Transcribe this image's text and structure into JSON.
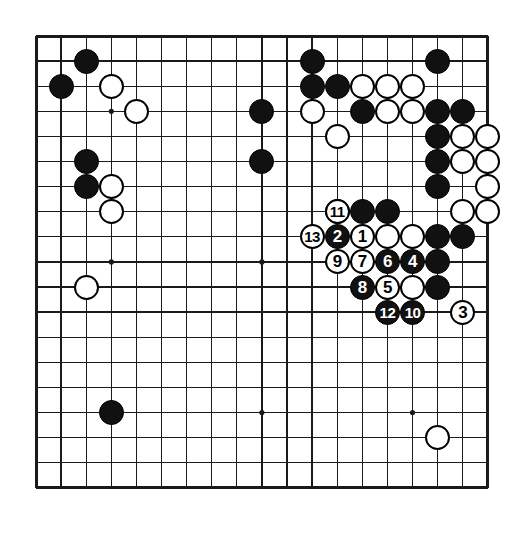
{
  "diagram": {
    "kind": "go-board-diagram",
    "board_size": 19,
    "colors": {
      "board_background": "#ffffff",
      "grid_line": "#1a1a1a",
      "black_stone": "#111111",
      "white_stone": "#ffffff",
      "stone_outline": "#000000",
      "black_number_text": "#ffffff",
      "white_number_text": "#000000"
    },
    "geometry": {
      "origin_x": 7,
      "origin_y": 7,
      "spacing": 25.1,
      "stone_diameter": 25,
      "border_width": 3
    },
    "star_points": [
      {
        "col": 4,
        "row": 4
      },
      {
        "col": 10,
        "row": 4
      },
      {
        "col": 16,
        "row": 4
      },
      {
        "col": 4,
        "row": 10
      },
      {
        "col": 10,
        "row": 10
      },
      {
        "col": 16,
        "row": 10
      },
      {
        "col": 4,
        "row": 16
      },
      {
        "col": 10,
        "row": 16
      },
      {
        "col": 16,
        "row": 16
      }
    ]
  },
  "stones": {
    "black_plain": [
      {
        "col": 3,
        "row": 2
      },
      {
        "col": 2,
        "row": 3
      },
      {
        "col": 3,
        "row": 6
      },
      {
        "col": 3,
        "row": 7
      },
      {
        "col": 10,
        "row": 4
      },
      {
        "col": 10,
        "row": 6
      },
      {
        "col": 12,
        "row": 3
      },
      {
        "col": 13,
        "row": 3
      },
      {
        "col": 12,
        "row": 2
      },
      {
        "col": 14,
        "row": 4
      },
      {
        "col": 17,
        "row": 2
      },
      {
        "col": 17,
        "row": 4
      },
      {
        "col": 18,
        "row": 4
      },
      {
        "col": 17,
        "row": 5
      },
      {
        "col": 17,
        "row": 6
      },
      {
        "col": 17,
        "row": 7
      },
      {
        "col": 13,
        "row": 8
      },
      {
        "col": 14,
        "row": 8
      },
      {
        "col": 15,
        "row": 8
      },
      {
        "col": 17,
        "row": 9
      },
      {
        "col": 18,
        "row": 9
      },
      {
        "col": 17,
        "row": 10
      },
      {
        "col": 17,
        "row": 11
      },
      {
        "col": 4,
        "row": 16
      }
    ],
    "white_plain": [
      {
        "col": 4,
        "row": 3
      },
      {
        "col": 5,
        "row": 4
      },
      {
        "col": 4,
        "row": 7
      },
      {
        "col": 4,
        "row": 8
      },
      {
        "col": 3,
        "row": 11
      },
      {
        "col": 12,
        "row": 4
      },
      {
        "col": 13,
        "row": 5
      },
      {
        "col": 14,
        "row": 3
      },
      {
        "col": 15,
        "row": 3
      },
      {
        "col": 16,
        "row": 3
      },
      {
        "col": 15,
        "row": 4
      },
      {
        "col": 16,
        "row": 4
      },
      {
        "col": 18,
        "row": 5
      },
      {
        "col": 19,
        "row": 5
      },
      {
        "col": 18,
        "row": 6
      },
      {
        "col": 19,
        "row": 6
      },
      {
        "col": 19,
        "row": 7
      },
      {
        "col": 18,
        "row": 8
      },
      {
        "col": 19,
        "row": 8
      },
      {
        "col": 16,
        "row": 9
      },
      {
        "col": 15,
        "row": 9
      },
      {
        "col": 16,
        "row": 11
      },
      {
        "col": 17,
        "row": 17
      }
    ],
    "numbered": [
      {
        "num": "1",
        "color": "white",
        "col": 14,
        "row": 9
      },
      {
        "num": "2",
        "color": "black",
        "col": 13,
        "row": 9
      },
      {
        "num": "3",
        "color": "white",
        "col": 18,
        "row": 12
      },
      {
        "num": "4",
        "color": "black",
        "col": 16,
        "row": 10
      },
      {
        "num": "5",
        "color": "white",
        "col": 15,
        "row": 11
      },
      {
        "num": "6",
        "color": "black",
        "col": 15,
        "row": 10
      },
      {
        "num": "7",
        "color": "white",
        "col": 14,
        "row": 10
      },
      {
        "num": "8",
        "color": "black",
        "col": 14,
        "row": 11
      },
      {
        "num": "9",
        "color": "white",
        "col": 13,
        "row": 10
      },
      {
        "num": "10",
        "color": "black",
        "col": 16,
        "row": 12
      },
      {
        "num": "11",
        "color": "white",
        "col": 13,
        "row": 8
      },
      {
        "num": "12",
        "color": "black",
        "col": 15,
        "row": 12
      },
      {
        "num": "13",
        "color": "white",
        "col": 12,
        "row": 9
      }
    ]
  }
}
